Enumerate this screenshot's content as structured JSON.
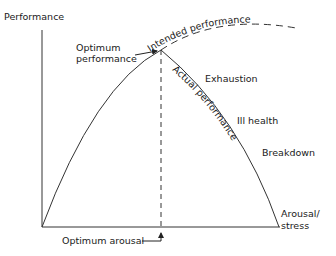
{
  "diagram": {
    "type": "inverted-U performance vs arousal curve",
    "y_axis_label": "Performance",
    "x_axis_label_line1": "Arousal/",
    "x_axis_label_line2": "stress",
    "optimum_performance_line1": "Optimum",
    "optimum_performance_line2": "performance",
    "optimum_arousal": "Optimum arousal",
    "intended_performance": "Intended performance",
    "actual_performance": "Actual performance",
    "stages": [
      "Exhaustion",
      "Ill health",
      "Breakdown"
    ],
    "colors": {
      "line": "#333333",
      "text": "#1a1a1a",
      "background": "#ffffff"
    }
  }
}
